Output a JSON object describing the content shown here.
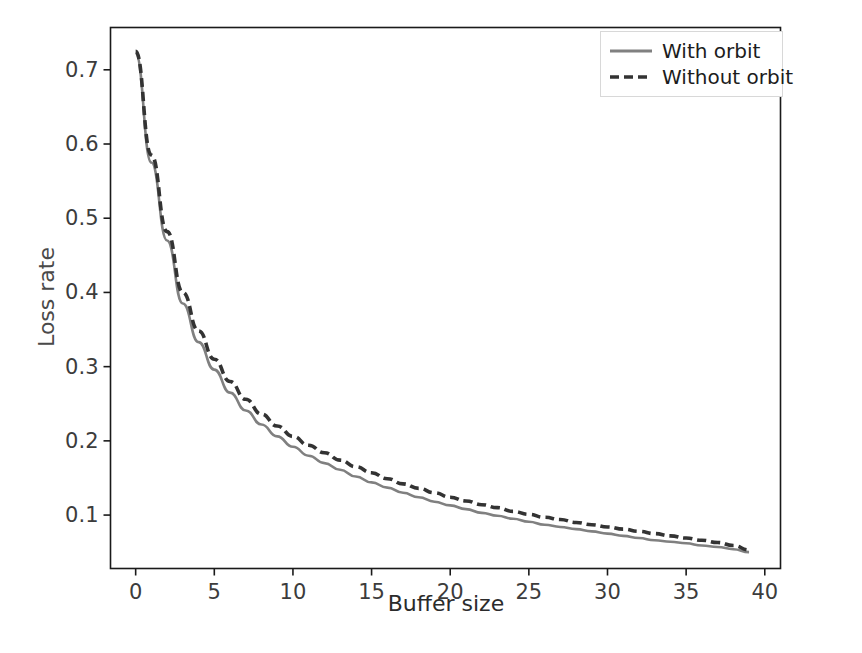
{
  "chart_data": {
    "type": "line",
    "title": "",
    "xlabel": "Buffer size",
    "ylabel": "Loss rate",
    "xlim": [
      -1.6,
      41.0
    ],
    "ylim": [
      0.028,
      0.757
    ],
    "xticks": [
      0,
      5,
      10,
      15,
      20,
      25,
      30,
      35,
      40
    ],
    "xticklabels": [
      "0",
      "5",
      "10",
      "15",
      "20",
      "25",
      "30",
      "35",
      "40"
    ],
    "yticks": [
      0.1,
      0.2,
      0.3,
      0.4,
      0.5,
      0.6,
      0.7
    ],
    "yticklabels": [
      "0.1",
      "0.2",
      "0.3",
      "0.4",
      "0.5",
      "0.6",
      "0.7"
    ],
    "grid": false,
    "legend_position": "upper right",
    "x": [
      0,
      1,
      2,
      3,
      4,
      5,
      6,
      7,
      8,
      9,
      10,
      11,
      12,
      13,
      14,
      15,
      16,
      17,
      18,
      19,
      20,
      21,
      22,
      23,
      24,
      25,
      26,
      27,
      28,
      29,
      30,
      31,
      32,
      33,
      34,
      35,
      36,
      37,
      38,
      39
    ],
    "series": [
      {
        "name": "With orbit",
        "style": "solid",
        "color": "#808080",
        "values": [
          0.722,
          0.575,
          0.47,
          0.385,
          0.333,
          0.296,
          0.265,
          0.241,
          0.222,
          0.206,
          0.192,
          0.18,
          0.17,
          0.161,
          0.152,
          0.144,
          0.137,
          0.13,
          0.124,
          0.118,
          0.113,
          0.108,
          0.103,
          0.099,
          0.095,
          0.091,
          0.087,
          0.084,
          0.081,
          0.078,
          0.075,
          0.072,
          0.069,
          0.066,
          0.064,
          0.062,
          0.059,
          0.057,
          0.054,
          0.05
        ]
      },
      {
        "name": "Without orbit",
        "style": "dashed",
        "color": "#333333",
        "values": [
          0.725,
          0.585,
          0.482,
          0.4,
          0.348,
          0.31,
          0.28,
          0.256,
          0.236,
          0.22,
          0.206,
          0.194,
          0.184,
          0.174,
          0.165,
          0.157,
          0.149,
          0.142,
          0.136,
          0.13,
          0.124,
          0.119,
          0.114,
          0.11,
          0.105,
          0.101,
          0.097,
          0.094,
          0.09,
          0.087,
          0.084,
          0.081,
          0.078,
          0.075,
          0.072,
          0.069,
          0.066,
          0.063,
          0.059,
          0.053
        ]
      }
    ]
  },
  "legend": {
    "entries": [
      {
        "label": "With orbit"
      },
      {
        "label": "Without orbit"
      }
    ]
  },
  "axes": {
    "xlabel": "Buffer size",
    "ylabel": "Loss rate"
  },
  "colors": {
    "with_orbit": "#808080",
    "without_orbit": "#333333",
    "frame": "#1a1a1a",
    "background": "#ffffff"
  }
}
